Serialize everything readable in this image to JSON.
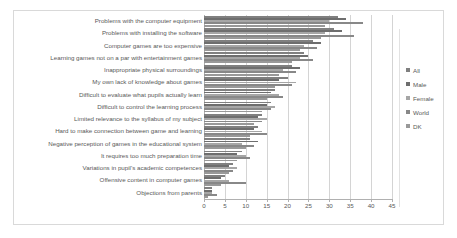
{
  "chart_data": {
    "type": "bar",
    "orientation": "horizontal",
    "title": "",
    "xlabel": "",
    "ylabel": "",
    "xlim": [
      0,
      45
    ],
    "xticks": [
      0,
      5,
      10,
      15,
      20,
      25,
      30,
      35,
      40,
      45
    ],
    "grid": true,
    "legend_position": "right",
    "categories": [
      "Problems with the computer equipment",
      "Problems with installing the software",
      "Computer games are too expensive",
      "Learning games not on a par with entertainment games",
      "Inappropriate physical surroundings",
      "My own lack of knowledge about  games",
      "Difficult to evaluate what pupils actually learn",
      "Difficult to control the learning process",
      "Limited relevance to the syllabus of my subject",
      "Hard to make connection between game and learning",
      "Negative perception of games in the educational system",
      "It requires too much preparation time",
      "Variations in pupil's academic competences",
      "Offensive content in computer games",
      "Objections from parents"
    ],
    "series": [
      {
        "name": "All",
        "color": "#808080",
        "values": [
          32.0,
          31.0,
          26.0,
          24.0,
          21.0,
          20.0,
          17.0,
          16.0,
          14.0,
          13.0,
          11.0,
          9.0,
          7.0,
          5.0,
          2.0
        ]
      },
      {
        "name": "Male",
        "color": "#6e6e6e",
        "values": [
          34.0,
          33.0,
          28.0,
          25.0,
          23.0,
          18.0,
          16.0,
          15.0,
          13.0,
          12.0,
          13.0,
          8.0,
          6.0,
          4.0,
          2.0
        ]
      },
      {
        "name": "Female",
        "color": "#a6a6a6",
        "values": [
          30.0,
          29.0,
          24.0,
          23.0,
          19.0,
          22.0,
          18.0,
          17.0,
          15.0,
          14.0,
          9.0,
          10.0,
          8.0,
          6.0,
          2.0
        ]
      },
      {
        "name": "World",
        "color": "#888888",
        "values": [
          38.0,
          36.0,
          27.0,
          26.0,
          22.0,
          21.0,
          19.0,
          16.0,
          14.0,
          15.0,
          12.0,
          11.0,
          7.0,
          10.0,
          3.0
        ]
      },
      {
        "name": "DK",
        "color": "#999999",
        "values": [
          29.0,
          28.0,
          23.0,
          21.0,
          18.0,
          17.0,
          15.0,
          14.0,
          12.0,
          11.0,
          10.0,
          8.0,
          6.0,
          4.0,
          1.0
        ]
      }
    ]
  },
  "legend": {
    "items": [
      {
        "label": "All"
      },
      {
        "label": "Male"
      },
      {
        "label": "Female"
      },
      {
        "label": "World"
      },
      {
        "label": "DK"
      }
    ]
  }
}
